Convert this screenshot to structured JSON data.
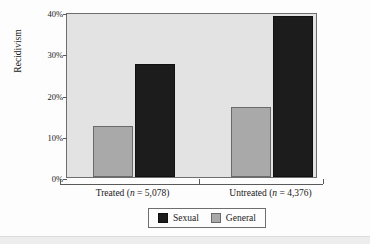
{
  "chart_data": {
    "type": "bar",
    "title": "",
    "xlabel": "",
    "ylabel": "Recidivism",
    "categories": [
      "Treated (n = 5,078)",
      "Untreated (n = 4,376)"
    ],
    "category_parts": [
      {
        "name": "Treated",
        "n_prefix": "(",
        "n_italic": "n",
        "n_rest": " = 5,078)"
      },
      {
        "name": "Untreated",
        "n_prefix": "(",
        "n_italic": "n",
        "n_rest": " = 4,376)"
      }
    ],
    "series": [
      {
        "name": "Sexual",
        "color": "#1c1c1c",
        "values": [
          27.5,
          39.0
        ]
      },
      {
        "name": "General",
        "color": "#a9a9a9",
        "values": [
          12.3,
          17.0
        ]
      }
    ],
    "series_order_in_plot": [
      "General",
      "Sexual"
    ],
    "ylim": [
      0,
      40
    ],
    "yticks": [
      0,
      10,
      20,
      30,
      40
    ],
    "ytick_labels": [
      "0%",
      "10%",
      "20%",
      "30%",
      "40%"
    ],
    "grid": false,
    "legend_position": "bottom",
    "legend_entries": [
      "Sexual",
      "General"
    ],
    "plot_background": "#e3e3e3",
    "figure_background": "#fdfdfd"
  }
}
